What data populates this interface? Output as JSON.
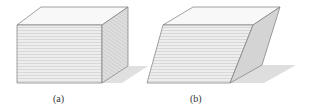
{
  "figures": [
    {
      "id": "a",
      "caption": "(a)",
      "description": "rectangular block (undeformed)",
      "front_face": [
        [
          17,
          25
        ],
        [
          102,
          25
        ],
        [
          102,
          83
        ],
        [
          17,
          83
        ]
      ],
      "top_face": [
        [
          17,
          25
        ],
        [
          41,
          7
        ],
        [
          128,
          7
        ],
        [
          102,
          25
        ]
      ],
      "side_face": [
        [
          102,
          25
        ],
        [
          128,
          7
        ],
        [
          128,
          66
        ],
        [
          102,
          83
        ]
      ],
      "shadow": [
        [
          102,
          83
        ],
        [
          128,
          66
        ],
        [
          148,
          66
        ],
        [
          122,
          83
        ]
      ]
    },
    {
      "id": "b",
      "caption": "(b)",
      "description": "sheared block (deformed)",
      "front_face": [
        [
          163,
          25
        ],
        [
          253,
          25
        ],
        [
          230,
          83
        ],
        [
          147,
          83
        ]
      ],
      "top_face": [
        [
          163,
          25
        ],
        [
          193,
          7
        ],
        [
          280,
          7
        ],
        [
          253,
          25
        ]
      ],
      "side_face": [
        [
          253,
          25
        ],
        [
          280,
          7
        ],
        [
          262,
          65
        ],
        [
          230,
          83
        ]
      ],
      "shadow": [
        [
          230,
          83
        ],
        [
          262,
          65
        ],
        [
          296,
          65
        ],
        [
          264,
          83
        ]
      ]
    }
  ],
  "colors": {
    "front_fill": "#ececec",
    "front_lines": "#c8c8c8",
    "top_fill": "#f7f7f7",
    "side_fill_a": "#d9d9d9",
    "side_fill_b": "#d2d2d2",
    "shadow_fill": "#dcdcdc",
    "edge": "#7a7a7a"
  }
}
